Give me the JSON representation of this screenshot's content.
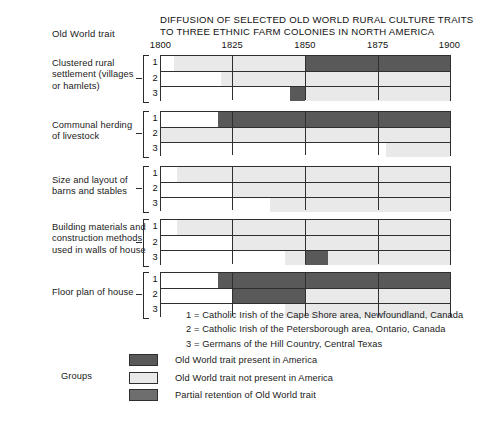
{
  "header": {
    "row_label_header": "Old World trait",
    "title_line1": "DIFFUSION OF SELECTED OLD WORLD RURAL CULTURE TRAITS",
    "title_line2": "TO THREE ETHNIC FARM COLONIES IN NORTH AMERICA"
  },
  "legend": {
    "groups_word": "Groups",
    "items": [
      {
        "key": "present",
        "label": "Old World trait present in America",
        "color": "#595959"
      },
      {
        "key": "absent",
        "label": "Old World trait not present in America",
        "color": "#e9e9e9"
      },
      {
        "key": "partial",
        "label": "Partial retention of Old World trait",
        "color": "#6e6e6e"
      }
    ],
    "group_key": [
      "1 = Catholic Irish of the Cape Shore area, Newfoundland, Canada",
      "2 = Catholic Irish of the Petersborough area, Ontario, Canada",
      "3 = Germans of the Hill Country, Central Texas"
    ]
  },
  "chart_data": {
    "type": "bar",
    "subtype": "timeline-gantt",
    "title": "DIFFUSION OF SELECTED OLD WORLD RURAL CULTURE TRAITS TO THREE ETHNIC FARM COLONIES IN NORTH AMERICA",
    "xlabel": "",
    "ylabel": "Old World trait",
    "xlim": [
      1800,
      1900
    ],
    "xticks": [
      1800,
      1825,
      1850,
      1875,
      1900
    ],
    "xticklabels": [
      "1800",
      "1825",
      "1850",
      "1875",
      "1900"
    ],
    "gridlines": [
      1825,
      1850,
      1875
    ],
    "grid": true,
    "legend_position": "bottom-left",
    "categories": [
      "Clustered rural settlement (villages or hamlets)",
      "Communal herding of livestock",
      "Size and layout of barns and stables",
      "Building materials and construction methods used in walls of house",
      "Floor plan of house"
    ],
    "series_keys": [
      "present",
      "absent",
      "partial",
      "none"
    ],
    "traits": [
      {
        "name": "Clustered rural settlement (villages or hamlets)",
        "label_lines": [
          "Clustered rural",
          "settlement (villages",
          "or hamlets)"
        ],
        "rows": [
          {
            "group": "1",
            "segments": [
              {
                "start": 1800,
                "end": 1805,
                "state": "none"
              },
              {
                "start": 1805,
                "end": 1850,
                "state": "absent"
              },
              {
                "start": 1850,
                "end": 1900,
                "state": "present"
              }
            ]
          },
          {
            "group": "2",
            "segments": [
              {
                "start": 1800,
                "end": 1821,
                "state": "none"
              },
              {
                "start": 1821,
                "end": 1900,
                "state": "absent"
              }
            ]
          },
          {
            "group": "3",
            "segments": [
              {
                "start": 1800,
                "end": 1845,
                "state": "none"
              },
              {
                "start": 1845,
                "end": 1850,
                "state": "present"
              },
              {
                "start": 1850,
                "end": 1900,
                "state": "absent"
              }
            ]
          }
        ]
      },
      {
        "name": "Communal herding of livestock",
        "label_lines": [
          "Communal herding",
          "of livestock"
        ],
        "rows": [
          {
            "group": "1",
            "segments": [
              {
                "start": 1800,
                "end": 1820,
                "state": "none"
              },
              {
                "start": 1820,
                "end": 1900,
                "state": "present"
              }
            ]
          },
          {
            "group": "2",
            "segments": [
              {
                "start": 1800,
                "end": 1800,
                "state": "none"
              },
              {
                "start": 1800,
                "end": 1900,
                "state": "absent"
              }
            ]
          },
          {
            "group": "3",
            "segments": [
              {
                "start": 1800,
                "end": 1878,
                "state": "none"
              },
              {
                "start": 1878,
                "end": 1900,
                "state": "absent"
              }
            ]
          }
        ]
      },
      {
        "name": "Size and layout of barns and stables",
        "label_lines": [
          "Size and layout of",
          "barns and stables"
        ],
        "rows": [
          {
            "group": "1",
            "segments": [
              {
                "start": 1800,
                "end": 1806,
                "state": "none"
              },
              {
                "start": 1806,
                "end": 1900,
                "state": "absent"
              }
            ]
          },
          {
            "group": "2",
            "segments": [
              {
                "start": 1800,
                "end": 1825,
                "state": "none"
              },
              {
                "start": 1825,
                "end": 1900,
                "state": "absent"
              }
            ]
          },
          {
            "group": "3",
            "segments": [
              {
                "start": 1800,
                "end": 1838,
                "state": "none"
              },
              {
                "start": 1838,
                "end": 1900,
                "state": "absent"
              }
            ]
          }
        ]
      },
      {
        "name": "Building materials and construction methods used in walls of house",
        "label_lines": [
          "Building materials and",
          "construction methods",
          "used in walls of house"
        ],
        "rows": [
          {
            "group": "1",
            "segments": [
              {
                "start": 1800,
                "end": 1806,
                "state": "none"
              },
              {
                "start": 1806,
                "end": 1900,
                "state": "absent"
              }
            ]
          },
          {
            "group": "2",
            "segments": [
              {
                "start": 1800,
                "end": 1825,
                "state": "none"
              },
              {
                "start": 1825,
                "end": 1900,
                "state": "absent"
              }
            ]
          },
          {
            "group": "3",
            "segments": [
              {
                "start": 1800,
                "end": 1843,
                "state": "none"
              },
              {
                "start": 1843,
                "end": 1850,
                "state": "absent"
              },
              {
                "start": 1850,
                "end": 1858,
                "state": "present"
              },
              {
                "start": 1858,
                "end": 1900,
                "state": "absent"
              }
            ]
          }
        ]
      },
      {
        "name": "Floor plan of house",
        "label_lines": [
          "Floor plan of house"
        ],
        "rows": [
          {
            "group": "1",
            "segments": [
              {
                "start": 1800,
                "end": 1820,
                "state": "none"
              },
              {
                "start": 1820,
                "end": 1900,
                "state": "present"
              }
            ]
          },
          {
            "group": "2",
            "segments": [
              {
                "start": 1800,
                "end": 1825,
                "state": "none"
              },
              {
                "start": 1825,
                "end": 1850,
                "state": "present"
              },
              {
                "start": 1850,
                "end": 1900,
                "state": "absent"
              }
            ]
          },
          {
            "group": "3",
            "segments": [
              {
                "start": 1800,
                "end": 1843,
                "state": "none"
              },
              {
                "start": 1843,
                "end": 1900,
                "state": "absent"
              }
            ]
          }
        ]
      }
    ],
    "state_colors": {
      "present": "#595959",
      "absent": "#e9e9e9",
      "partial": "#6e6e6e",
      "none": "#ffffff"
    }
  }
}
